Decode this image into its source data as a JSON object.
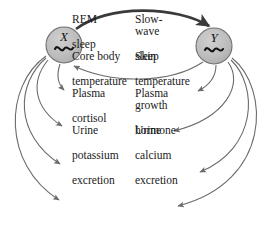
{
  "diagram": {
    "background_color": "#ffffff",
    "node_fill": "#b9b9b9",
    "node_stroke": "#5a5a5a",
    "arrow_color": "#6b6b6b",
    "strong_arrow_color": "#3a3a3a",
    "text_color": "#1a1a1a"
  },
  "oscillators": {
    "x": {
      "label": "X",
      "wave_glyph": "~",
      "cx": 64,
      "cy": 45,
      "r": 18
    },
    "y": {
      "label": "Y",
      "wave_glyph": "~",
      "cx": 214,
      "cy": 46,
      "r": 18
    }
  },
  "columns": {
    "left": {
      "source": "X",
      "items": [
        {
          "line1": "REM",
          "line2": "sleep",
          "line3": ""
        },
        {
          "line1": "Core body",
          "line2": "temperature",
          "line3": ""
        },
        {
          "line1": "Plasma",
          "line2": "cortisol",
          "line3": ""
        },
        {
          "line1": "Urine",
          "line2": "potassium",
          "line3": "excretion"
        }
      ]
    },
    "right": {
      "source": "Y",
      "items": [
        {
          "line1": "Slow-wave",
          "line2": "sleep",
          "line3": ""
        },
        {
          "line1": "Skin",
          "line2": "temperature",
          "line3": ""
        },
        {
          "line1": "Plasma growth",
          "line2": "hormone",
          "line3": ""
        },
        {
          "line1": "Urine",
          "line2": "calcium",
          "line3": "excretion"
        }
      ]
    }
  },
  "connections": {
    "x_to_y": {
      "from": "X",
      "to": "Y",
      "style": "thick",
      "direction": "right"
    },
    "y_to_x": {
      "from": "Y",
      "to": "X",
      "style": "thin",
      "direction": "left"
    }
  }
}
